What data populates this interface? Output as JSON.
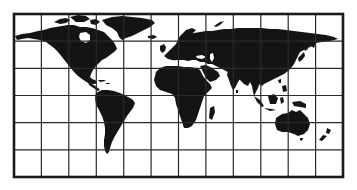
{
  "map": {
    "title": "World map with grid",
    "projection": "cylindrical (Miller-style)",
    "land_color": "#141414",
    "water_color": "#ffffff",
    "grid_color": "#2a2a2a",
    "frame": {
      "x": 14,
      "y": 14,
      "width": 329,
      "height": 163
    },
    "grid": {
      "columns": 12,
      "rows": 6
    },
    "regions": [
      "North America",
      "Greenland",
      "South America",
      "Europe",
      "Africa",
      "Madagascar",
      "Asia",
      "Arabian Peninsula",
      "Indian Subcontinent",
      "Japan",
      "Southeast Asia / Indonesia",
      "Australia",
      "Tasmania",
      "New Zealand",
      "Iceland",
      "British Isles"
    ]
  }
}
